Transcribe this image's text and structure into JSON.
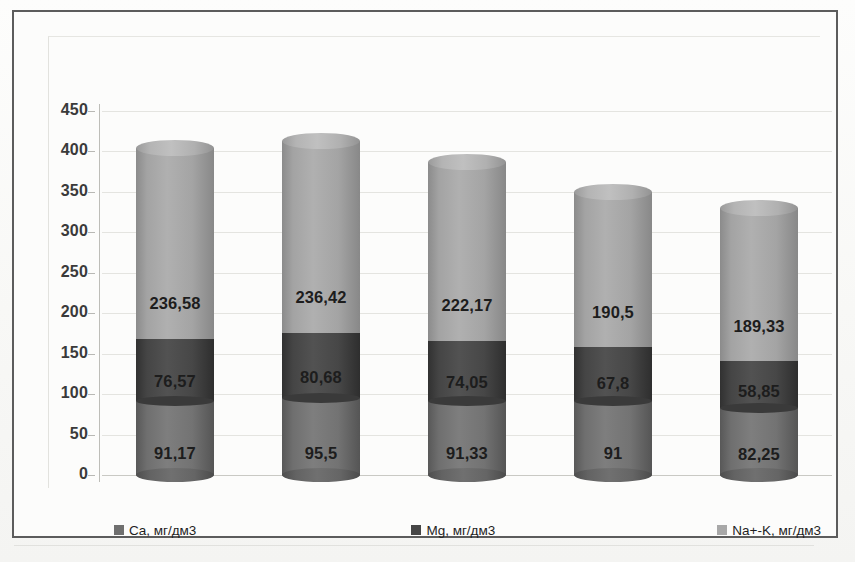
{
  "chart_data": {
    "type": "bar",
    "title": "",
    "xlabel": "",
    "ylabel": "",
    "stacked": true,
    "grid": true,
    "legend_position": "bottom",
    "ylim": [
      0,
      450
    ],
    "yticks": [
      "0",
      "50",
      "100",
      "150",
      "200",
      "250",
      "300",
      "350",
      "400",
      "450"
    ],
    "ytick_values": [
      0,
      50,
      100,
      150,
      200,
      250,
      300,
      350,
      400,
      450
    ],
    "categories": [
      "2008",
      "2009",
      "2010",
      "2011",
      "2012"
    ],
    "series": [
      {
        "name": "Ca, мг/дм3",
        "key": "ca",
        "color": "#7e7e7e",
        "values": [
          91.17,
          95.5,
          91.33,
          91,
          82.25
        ],
        "labels": [
          "91,17",
          "95,5",
          "91,33",
          "91",
          "82,25"
        ]
      },
      {
        "name": "Mg, мг/дм3",
        "key": "mg",
        "color": "#4a4a4a",
        "values": [
          76.57,
          80.68,
          74.05,
          67.8,
          58.85
        ],
        "labels": [
          "76,57",
          "80,68",
          "74,05",
          "67,8",
          "58,85"
        ]
      },
      {
        "name": "Na+-K, мг/дм3",
        "key": "nak",
        "color": "#b0b0b0",
        "values": [
          236.58,
          236.42,
          222.17,
          190.5,
          189.33
        ],
        "labels": [
          "236,58",
          "236,42",
          "222,17",
          "190,5",
          "189,33"
        ]
      }
    ],
    "totals": [
      404.32,
      412.6,
      387.55,
      349.3,
      330.43
    ]
  },
  "legend": {
    "items": [
      {
        "label": "Ca, мг/дм3",
        "color": "#6f6f6f"
      },
      {
        "label": "Mg, мг/дм3",
        "color": "#464646"
      },
      {
        "label": "Na+-K, мг/дм3",
        "color": "#a8a8a8"
      }
    ]
  }
}
